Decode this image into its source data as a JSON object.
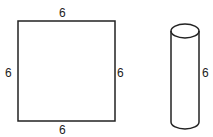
{
  "square": {
    "top_label": "6",
    "left_label": "6",
    "right_label": "6",
    "bottom_label": "6"
  },
  "cylinder": {
    "height_label": "6"
  },
  "colors": {
    "stroke": "#222222",
    "background": "#ffffff"
  }
}
